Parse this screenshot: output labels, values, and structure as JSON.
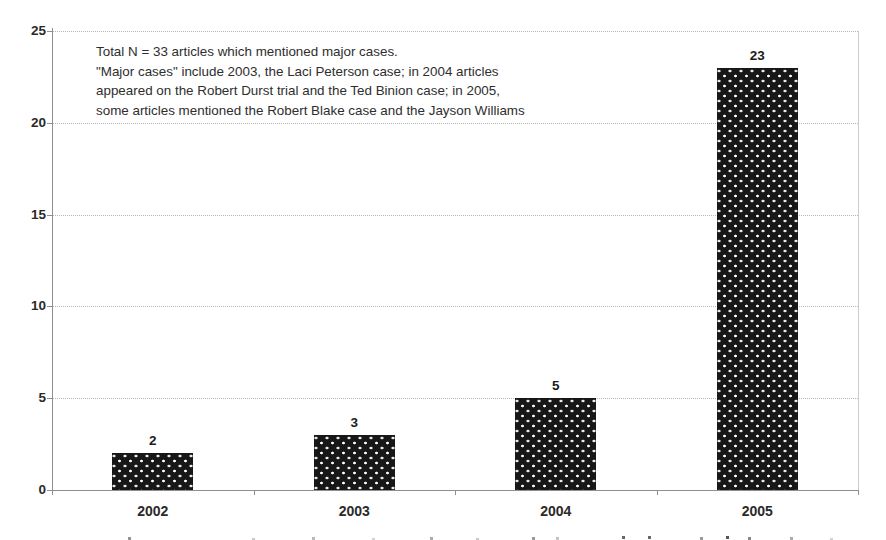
{
  "annotation": {
    "lines": [
      "Total N = 33 articles which mentioned major cases.",
      "\"Major cases\" include 2003, the Laci Peterson case; in 2004 articles",
      "appeared on the Robert Durst trial and the Ted Binion case; in 2005,",
      "some articles mentioned the Robert Blake case and the Jayson Williams"
    ]
  },
  "chart_data": {
    "type": "bar",
    "categories": [
      "2002",
      "2003",
      "2004",
      "2005"
    ],
    "values": [
      2,
      3,
      5,
      23
    ],
    "title": "",
    "xlabel": "",
    "ylabel": "",
    "ylim": [
      0,
      25
    ],
    "yticks": [
      0,
      5,
      10,
      15,
      20,
      25
    ],
    "grid": "horizontal-dotted",
    "legend": "none",
    "bar_style": "black-with-white-dot-pattern",
    "colors": {
      "bar_fill": "#171717",
      "bar_dots": "#ffffff",
      "gridline": "#b7b7b7",
      "axis": "#8f8f8f",
      "plot_border": "#cccccc",
      "text": "#2a2a2a",
      "background": "#ffffff"
    }
  }
}
